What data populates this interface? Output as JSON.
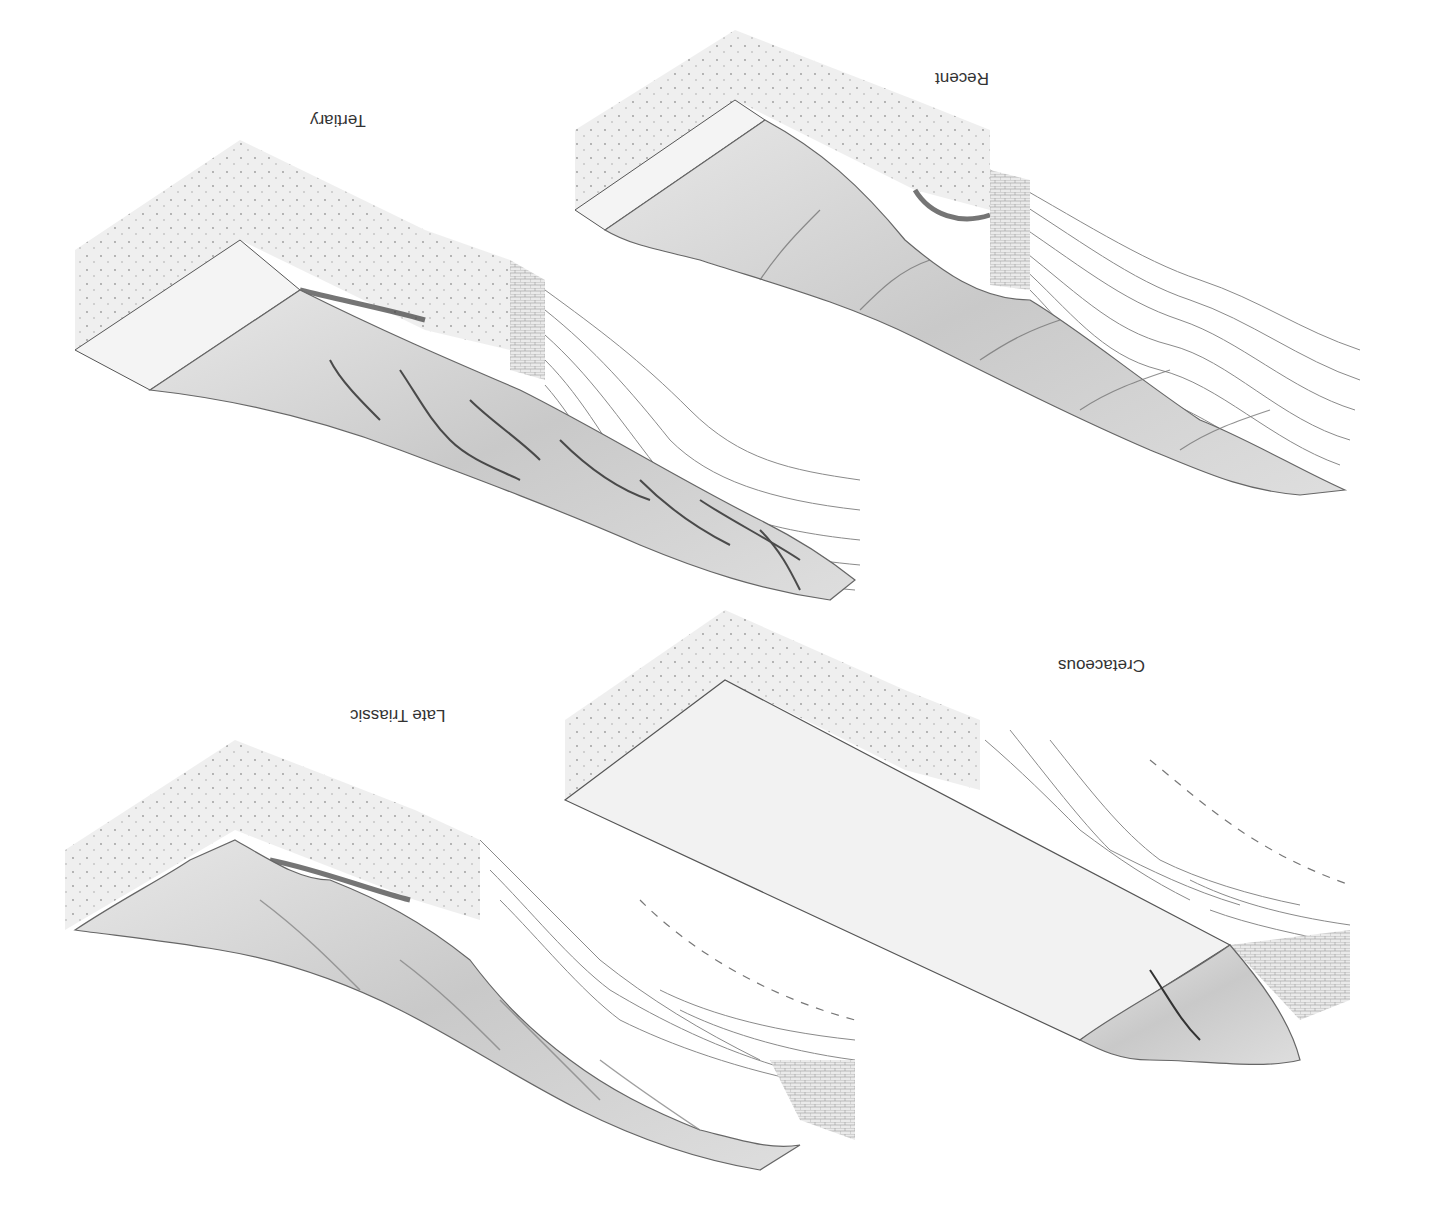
{
  "figure": {
    "orientation": "rotated-180",
    "panels": [
      {
        "id": "recent",
        "label": "Recent",
        "position": "top-right"
      },
      {
        "id": "tertiary",
        "label": "Tertiary",
        "position": "top-left"
      },
      {
        "id": "cretaceous",
        "label": "Cretaceous",
        "position": "bottom-right"
      },
      {
        "id": "late-triassic",
        "label": "Late Triassic",
        "position": "bottom-left"
      }
    ],
    "colors": {
      "background": "#ffffff",
      "outline": "#555555",
      "strata": "#8a8a8a",
      "dark_band": "#3a3a3a",
      "surface_fill": "#d8d8d8",
      "stipple_face": "#efefef",
      "plain_surface": "#f2f2f2"
    }
  }
}
